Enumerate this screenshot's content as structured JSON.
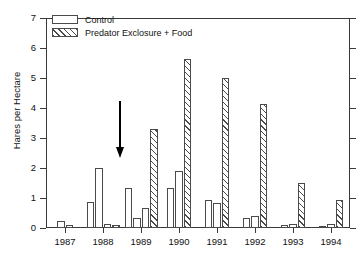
{
  "chart_data": {
    "type": "bar",
    "title": "",
    "xlabel": "",
    "ylabel": "Hares per Hectare",
    "ylim": [
      0,
      7
    ],
    "ytick_labels": [
      "0",
      "1",
      "2",
      "3",
      "4",
      "5",
      "6",
      "7"
    ],
    "ytick_values": [
      0,
      1,
      2,
      3,
      4,
      5,
      6,
      7
    ],
    "grid": false,
    "legend_position": "top-left",
    "categories": [
      "1987",
      "1988",
      "1989",
      "1990",
      "1991",
      "1992",
      "1993",
      "1994"
    ],
    "series": [
      {
        "name": "Control",
        "hatch": false,
        "values_by_year": [
          [
            0.22,
            0.1
          ],
          [
            0.88,
            2.0,
            0.15
          ],
          [
            1.35,
            0.33,
            0.68
          ],
          [
            1.35,
            1.9
          ],
          [
            0.95,
            0.85
          ],
          [
            0.35,
            0.4
          ],
          [
            0.1,
            0.15
          ],
          [
            0.08,
            0.15
          ]
        ]
      },
      {
        "name": "Predator Exclosure + Food",
        "hatch": true,
        "values_by_year": [
          [],
          [
            0.1
          ],
          [
            3.3
          ],
          [
            5.65
          ],
          [
            5.0
          ],
          [
            4.15
          ],
          [
            1.5
          ],
          [
            0.95
          ]
        ]
      }
    ],
    "annotations": [
      {
        "name": "treatment-start-arrow",
        "shape": "down-arrow",
        "at_category": "1988-1989 boundary",
        "label": ""
      }
    ]
  },
  "legend": {
    "items": [
      {
        "label": "Control",
        "swatch": "open-bar-swatch"
      },
      {
        "label": "Predator Exclosure + Food",
        "swatch": "hatched-bar-swatch"
      }
    ]
  },
  "axes": {
    "y_title": "Hares per Hectare",
    "y_labels": [
      "7",
      "6",
      "5",
      "4",
      "3",
      "2",
      "1",
      "0"
    ],
    "x_labels": [
      "1987",
      "1988",
      "1989",
      "1990",
      "1991",
      "1992",
      "1993",
      "1994"
    ]
  }
}
